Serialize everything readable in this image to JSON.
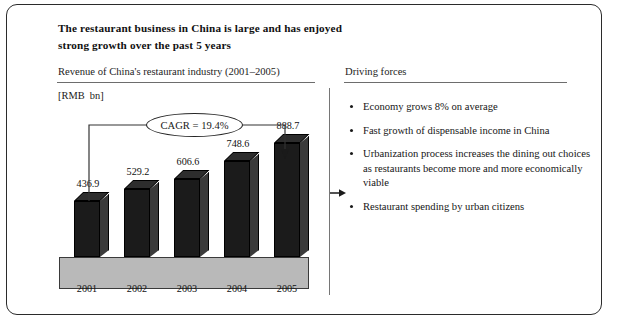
{
  "slide": {
    "headline": "The restaurant business in China is large and has enjoyed strong growth over the past 5 years",
    "left_panel_title": "Revenue of China's restaurant industry (2001–2005)",
    "right_panel_title": "Driving forces",
    "unit_label": "[RMB  bn]",
    "cagr_label": "CAGR  =  19.4%"
  },
  "chart_data": {
    "type": "bar",
    "title": "Revenue of China's restaurant industry (2001–2005)",
    "xlabel": "",
    "ylabel": "[RMB  bn]",
    "categories": [
      "2001",
      "2002",
      "2003",
      "2004",
      "2005"
    ],
    "values": [
      436.9,
      529.2,
      606.6,
      748.6,
      888.7
    ],
    "value_labels": [
      "436.9",
      "529.2",
      "606.6",
      "748.6",
      "888.7"
    ],
    "ylim": [
      0,
      1000
    ],
    "grid": false,
    "legend": null,
    "annotations": [
      "CAGR  =  19.4%"
    ],
    "series": [
      {
        "name": "Revenue",
        "values": [
          436.9,
          529.2,
          606.6,
          748.6,
          888.7
        ]
      }
    ]
  },
  "driving_forces": [
    {
      "text": "Economy grows 8% on average"
    },
    {
      "text": "Fast growth of dispensable income in China"
    },
    {
      "text": "Urbanization process increases the dining out choices as restaurants become more and more economically viable"
    },
    {
      "text": "Restaurant spending by urban citizens"
    }
  ],
  "colors": {
    "frame_border": "#2b2b2b",
    "bar_front": "#1b1b1b",
    "bar_side": "#3a3a3a",
    "plinth": "#b9b9b9",
    "rule": "#6d6d6d",
    "divider": "#767676",
    "text": "#1a1a1a"
  }
}
